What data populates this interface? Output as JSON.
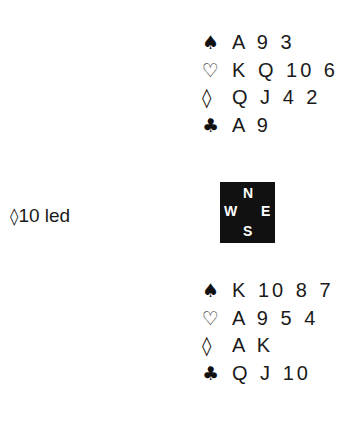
{
  "north": {
    "rows": [
      {
        "suit": "spade",
        "symbol": "♠",
        "cards": "A 9 3"
      },
      {
        "suit": "heart",
        "symbol": "♡",
        "cards": "K Q 10 6"
      },
      {
        "suit": "diamond",
        "symbol": "◊",
        "cards": "Q J 4 2"
      },
      {
        "suit": "club",
        "symbol": "♣",
        "cards": "A 9"
      }
    ]
  },
  "south": {
    "rows": [
      {
        "suit": "spade",
        "symbol": "♠",
        "cards": "K 10 8 7"
      },
      {
        "suit": "heart",
        "symbol": "♡",
        "cards": "A 9 5 4"
      },
      {
        "suit": "diamond",
        "symbol": "◊",
        "cards": "A K"
      },
      {
        "suit": "club",
        "symbol": "♣",
        "cards": "Q J 10"
      }
    ]
  },
  "compass": {
    "n": "N",
    "w": "W",
    "e": "E",
    "s": "S",
    "background": "#111111",
    "text_color": "#ffffff"
  },
  "lead": {
    "suit_symbol": "◊",
    "text": "10 led"
  }
}
